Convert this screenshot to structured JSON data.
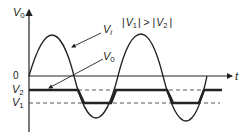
{
  "diagram": {
    "y_axis_label": "V",
    "y_axis_label_sub": "0",
    "x_axis_label": "t",
    "origin_label": "0",
    "level_labels": [
      {
        "name": "V",
        "sub": "2"
      },
      {
        "name": "V",
        "sub": "1"
      }
    ],
    "condition": {
      "left_bar": "|",
      "v1": "V",
      "v1_sub": "1",
      "op": "| > |",
      "v2": "V",
      "v2_sub": "2",
      "right_bar": "|"
    },
    "curves": [
      {
        "name": "input",
        "label": "V",
        "label_sub": "i",
        "style": "thin sinusoid"
      },
      {
        "name": "output",
        "label": "V",
        "label_sub": "0",
        "style": "thick clipped between V2 and V1"
      }
    ],
    "colors": {
      "stroke": "#222222",
      "background": "#ffffff"
    }
  }
}
